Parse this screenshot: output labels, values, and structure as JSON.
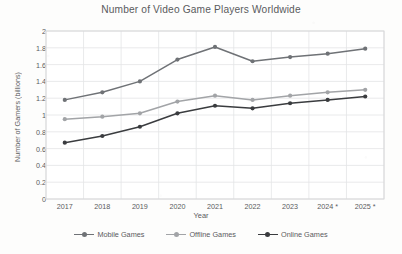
{
  "chart_data": {
    "type": "line",
    "title": "Number of Video Game Players Worldwide",
    "xlabel": "Year",
    "ylabel": "Number of Gamers (billions)",
    "categories": [
      "2017",
      "2018",
      "2019",
      "2020",
      "2021",
      "2022",
      "2023",
      "2024 *",
      "2025 *"
    ],
    "ylim": [
      0,
      2
    ],
    "yticks": [
      0,
      0.2,
      0.4,
      0.6,
      0.8,
      1,
      1.2,
      1.4,
      1.6,
      1.8,
      2
    ],
    "ytick_labels": [
      "0",
      "0.2",
      "0.4",
      "0.6",
      "0.8",
      "1",
      "1.2",
      "1.4",
      "1.6",
      "1.8",
      "2"
    ],
    "grid": true,
    "legend_position": "bottom",
    "markers": "circle",
    "series": [
      {
        "name": "Mobile Games",
        "color": "#6f7276",
        "values": [
          1.18,
          1.27,
          1.4,
          1.66,
          1.81,
          1.64,
          1.69,
          1.73,
          1.79
        ]
      },
      {
        "name": "Offline Games",
        "color": "#a2a4a7",
        "values": [
          0.95,
          0.98,
          1.02,
          1.16,
          1.23,
          1.18,
          1.23,
          1.27,
          1.3
        ]
      },
      {
        "name": "Online Games",
        "color": "#3a3c3f",
        "values": [
          0.67,
          0.75,
          0.86,
          1.02,
          1.11,
          1.08,
          1.14,
          1.18,
          1.22
        ]
      }
    ]
  },
  "colors": {
    "background": "#fdfdfc",
    "text": "#5a5b5d",
    "grid": "#e3e4e6",
    "axis": "#d5d6d8"
  }
}
